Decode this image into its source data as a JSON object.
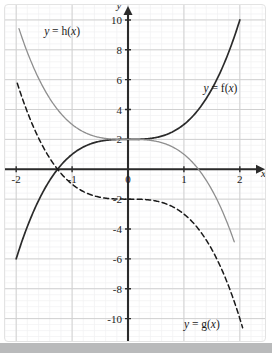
{
  "figure": {
    "background_color": "#ffffff",
    "bottom_band_color": "#b9babb"
  },
  "chart_data": {
    "type": "line",
    "title": "",
    "xlabel": "x",
    "ylabel": "y",
    "xlim": [
      -2.2,
      2.45
    ],
    "ylim": [
      -11.5,
      11.0
    ],
    "grid": true,
    "grid_major_step_x": 1,
    "grid_major_step_y": 2,
    "grid_minor_subdivisions": 5,
    "grid_major_color": "#d0d0d0",
    "grid_minor_color": "#f0f0f2",
    "axis_color": "#2b2b2b",
    "legend": "inline-labels",
    "xticks": [
      -2,
      -1,
      0,
      1,
      2
    ],
    "xtick_labels": [
      "-2",
      "-1",
      "0",
      "1",
      "2"
    ],
    "yticks": [
      -10,
      -8,
      -6,
      -4,
      -2,
      2,
      4,
      6,
      8,
      10
    ],
    "ytick_labels": [
      "-10",
      "-8",
      "-6",
      "-4",
      "-2",
      "2",
      "4",
      "6",
      "8",
      "10"
    ],
    "series": [
      {
        "name": "f",
        "label": "y = f(x)",
        "expression": "x^3 + 2",
        "color": "#2b2b2b",
        "width": 1.7,
        "style": "solid",
        "domain": [
          -2.0,
          2.0
        ],
        "key_points": [
          {
            "x": -2,
            "y": -6
          },
          {
            "x": -1.26,
            "y": 0
          },
          {
            "x": -1,
            "y": 1
          },
          {
            "x": 0,
            "y": 2
          },
          {
            "x": 1,
            "y": 3
          },
          {
            "x": 2,
            "y": 10
          }
        ],
        "label_pos": {
          "x": 1.35,
          "y": 5.2
        }
      },
      {
        "name": "h",
        "label": "y = h(x)",
        "expression": "-x^3 + 2",
        "color": "#8f8f8f",
        "width": 1.3,
        "style": "solid",
        "domain": [
          -1.95,
          1.9
        ],
        "key_points": [
          {
            "x": -1.95,
            "y": 9.4
          },
          {
            "x": -1,
            "y": 3
          },
          {
            "x": 0,
            "y": 2
          },
          {
            "x": 1,
            "y": 1
          },
          {
            "x": 1.26,
            "y": 0
          },
          {
            "x": 1.9,
            "y": -4.9
          }
        ],
        "label_pos": {
          "x": -1.5,
          "y": 9.0
        }
      },
      {
        "name": "g",
        "label": "y = g(x)",
        "expression": "-x^3 - 2",
        "color": "#1a1a1a",
        "width": 1.5,
        "style": "dashed",
        "domain": [
          -1.98,
          2.05
        ],
        "key_points": [
          {
            "x": -1.98,
            "y": 5.8
          },
          {
            "x": -1,
            "y": -1
          },
          {
            "x": 0,
            "y": -2
          },
          {
            "x": 1,
            "y": -3
          },
          {
            "x": 2,
            "y": -10
          }
        ],
        "label_pos": {
          "x": 1.0,
          "y": -10.6
        }
      }
    ],
    "annotations": [
      {
        "text": "y",
        "x": -0.12,
        "y": 10.7,
        "role": "y-axis-name"
      },
      {
        "text": "x",
        "x": 2.38,
        "y": -0.55,
        "role": "x-axis-name"
      }
    ]
  },
  "labels": {
    "f": "y = f(x)",
    "g": "y = g(x)",
    "h": "y = h(x)",
    "x_axis": "x",
    "y_axis": "y"
  }
}
